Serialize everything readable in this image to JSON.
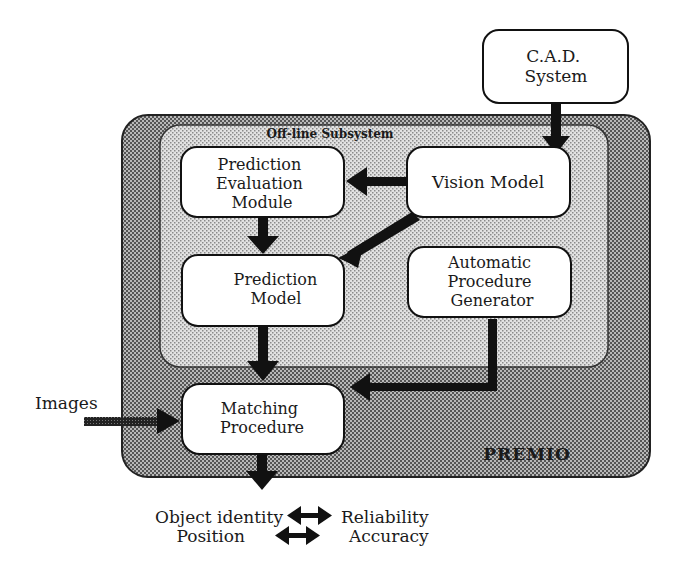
{
  "diagram": {
    "outer_container": {
      "label": "PREMIO"
    },
    "inner_container": {
      "label": "Off-line Subsystem"
    },
    "nodes": {
      "cad": {
        "lines": [
          "C.A.D.",
          "System"
        ]
      },
      "vision": {
        "lines": [
          "Vision Model"
        ]
      },
      "pem": {
        "lines": [
          "Prediction",
          "Evaluation",
          "Module"
        ]
      },
      "pm": {
        "lines": [
          "Prediction",
          "Model"
        ]
      },
      "apg": {
        "lines": [
          "Automatic",
          "Procedure",
          "Generator"
        ]
      },
      "matching": {
        "lines": [
          "Matching",
          "Procedure"
        ]
      }
    },
    "input_label": "Images",
    "outputs": {
      "row1_left": "Object identity",
      "row1_right": "Reliability",
      "row2_left": "Position",
      "row2_right": "Accuracy"
    },
    "edges": [
      {
        "from": "C.A.D. System",
        "to": "Vision Model"
      },
      {
        "from": "Vision Model",
        "to": "Prediction Evaluation Module"
      },
      {
        "from": "Vision Model",
        "to": "Prediction Model"
      },
      {
        "from": "Prediction Evaluation Module",
        "to": "Prediction Model"
      },
      {
        "from": "Prediction Model",
        "to": "Matching Procedure"
      },
      {
        "from": "Automatic Procedure Generator",
        "to": "Matching Procedure"
      },
      {
        "from": "Images",
        "to": "Matching Procedure"
      },
      {
        "from": "Matching Procedure",
        "to": "Outputs"
      }
    ],
    "colors": {
      "outer_fill": "#9a9a9a",
      "inner_fill": "#cfcfcf",
      "node_fill": "#ffffff",
      "stroke": "#111111"
    }
  }
}
